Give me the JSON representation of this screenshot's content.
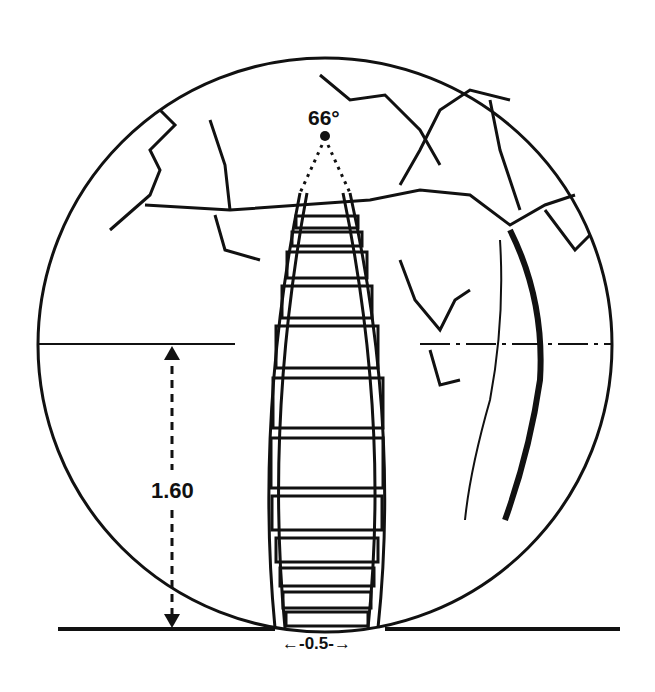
{
  "diagram": {
    "angle_label": "66°",
    "height_label": "1.60",
    "width_label": "←-0.5-→",
    "colors": {
      "ink": "#111111",
      "background": "#ffffff"
    }
  }
}
